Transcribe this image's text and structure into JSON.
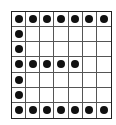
{
  "grid": {
    "rows": 7,
    "cols": 7,
    "dot_color": "#111111",
    "line_color": "#555555",
    "cells": [
      [
        1,
        1,
        1,
        1,
        1,
        1,
        1
      ],
      [
        1,
        0,
        0,
        0,
        0,
        0,
        0
      ],
      [
        1,
        0,
        0,
        0,
        0,
        0,
        0
      ],
      [
        1,
        1,
        1,
        1,
        1,
        0,
        0
      ],
      [
        1,
        0,
        0,
        0,
        0,
        0,
        0
      ],
      [
        1,
        0,
        0,
        0,
        0,
        0,
        0
      ],
      [
        1,
        1,
        1,
        1,
        1,
        1,
        1
      ]
    ]
  }
}
